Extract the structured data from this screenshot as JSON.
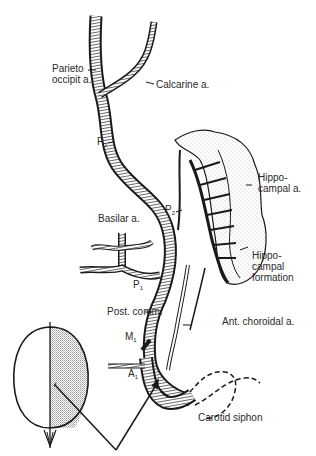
{
  "diagram": {
    "type": "anatomical-illustration",
    "labels": [
      {
        "id": "parieto",
        "line1": "Parieto",
        "line2": "occipit a."
      },
      {
        "id": "calcarine",
        "line1": "Calcarine a."
      },
      {
        "id": "p3",
        "base": "P",
        "sub": "3"
      },
      {
        "id": "p2",
        "base": "P",
        "sub": "2"
      },
      {
        "id": "p1",
        "base": "P",
        "sub": "1"
      },
      {
        "id": "hippocampal-a",
        "line1": "Hippo-",
        "line2": "campal a."
      },
      {
        "id": "hippocampal-formation",
        "line1": "Hippo-",
        "line2": "campal",
        "line3": "formation"
      },
      {
        "id": "basilar",
        "line1": "Basilar a."
      },
      {
        "id": "post-comm",
        "line1": "Post. comm."
      },
      {
        "id": "ant-choroidal",
        "line1": "Ant. choroidal a."
      },
      {
        "id": "m1",
        "base": "M",
        "sub": "1"
      },
      {
        "id": "a1",
        "base": "A",
        "sub": "1"
      },
      {
        "id": "carotid",
        "line1": "Carotid siphon"
      }
    ],
    "inset": {
      "description": "head outline viewed from above, right half shaded",
      "shaded_side": "right"
    },
    "colors": {
      "ink": "#1a1a1a",
      "label": "#2a2a2a",
      "stipple": "#9a9a9a",
      "background": "#ffffff"
    }
  }
}
